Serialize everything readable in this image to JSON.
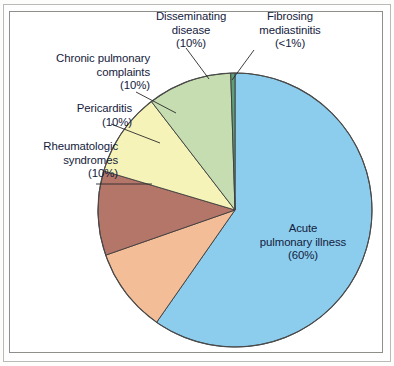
{
  "figure": {
    "title": "",
    "background_color": "#ffffff",
    "border_color": "#8e8e8a"
  },
  "chart_data": {
    "type": "pie",
    "title": "",
    "xlabel": "",
    "ylabel": "",
    "legend_position": "callout-labels",
    "grid": false,
    "total_percent": 100,
    "start_angle_deg": 90,
    "direction": "clockwise",
    "categories": [
      "Acute pulmonary illness",
      "Rheumatologic syndromes",
      "Pericarditis",
      "Chronic pulmonary complaints",
      "Disseminating disease",
      "Fibrosing mediastinitis"
    ],
    "values": [
      60,
      10,
      10,
      10,
      10,
      0.5
    ],
    "value_labels": [
      "(60%)",
      "(10%)",
      "(10%)",
      "(10%)",
      "(10%)",
      "(<1%)"
    ],
    "colors": [
      "#8ccdee",
      "#f3bd98",
      "#b5766a",
      "#f6f3b9",
      "#c5ddb0",
      "#5f9e78"
    ],
    "slices": [
      {
        "name": "Acute pulmonary illness",
        "label_line1": "Acute",
        "label_line2": "pulmonary illness",
        "label_line3": "(60%)",
        "percent": 60,
        "percent_text": "(60%)",
        "color": "#8ccdee",
        "label_placement": "inside"
      },
      {
        "name": "Rheumatologic syndromes",
        "label_line1": "Rheumatologic",
        "label_line2": "syndromes",
        "label_line3": "(10%)",
        "percent": 10,
        "percent_text": "(10%)",
        "color": "#f3bd98",
        "label_placement": "outside-left"
      },
      {
        "name": "Pericarditis",
        "label_line1": "Pericarditis",
        "label_line2": "(10%)",
        "label_line3": "",
        "percent": 10,
        "percent_text": "(10%)",
        "color": "#b5766a",
        "label_placement": "outside-left"
      },
      {
        "name": "Chronic pulmonary complaints",
        "label_line1": "Chronic pulmonary",
        "label_line2": "complaints",
        "label_line3": "(10%)",
        "percent": 10,
        "percent_text": "(10%)",
        "color": "#f6f3b9",
        "label_placement": "outside-left"
      },
      {
        "name": "Disseminating disease",
        "label_line1": "Disseminating",
        "label_line2": "disease",
        "label_line3": "(10%)",
        "percent": 10,
        "percent_text": "(10%)",
        "color": "#c5ddb0",
        "label_placement": "outside-top"
      },
      {
        "name": "Fibrosing mediastinitis",
        "label_line1": "Fibrosing",
        "label_line2": "mediastinitis",
        "label_line3": "(<1%)",
        "percent": 0.5,
        "percent_text": "(<1%)",
        "color": "#5f9e78",
        "label_placement": "outside-top"
      }
    ]
  },
  "labels": {
    "disseminating": "Disseminating\ndisease\n(10%)",
    "fibrosing": "Fibrosing\nmediastinitis\n(<1%)",
    "chronic": "Chronic pulmonary\ncomplaints\n(10%)",
    "pericarditis": "Pericarditis\n(10%)",
    "rheumatologic": "Rheumatologic\nsyndromes\n(10%)",
    "acute": "Acute\npulmonary illness\n(60%)"
  }
}
